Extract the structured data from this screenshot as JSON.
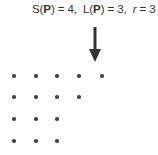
{
  "caption": {
    "s_label": "S(",
    "s_var": "P",
    "s_close": ") = ",
    "s_value": "4",
    "sep1": ",  ",
    "l_label": "L(",
    "l_var": "P",
    "l_close": ") = ",
    "l_value": "3",
    "sep2": ",  ",
    "r_var": "r",
    "r_eq": " = ",
    "r_value": "3"
  },
  "arrow": {
    "direction": "down",
    "icon": "down-arrow-icon",
    "color": "#333333"
  },
  "ferrers_diagram": {
    "rows": [
      5,
      4,
      3,
      3
    ],
    "dot_color": "#444444",
    "col_x": [
      14,
      36,
      57,
      79,
      102
    ],
    "row_y": [
      76,
      97,
      119,
      141
    ]
  }
}
